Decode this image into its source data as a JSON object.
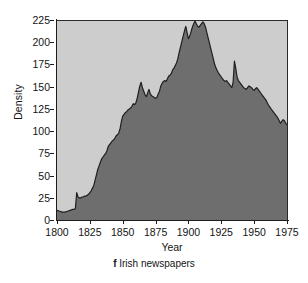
{
  "figure": {
    "caption_letter": "f",
    "caption_text": "Irish newspapers"
  },
  "colors": {
    "plot_background": "#cdcdcd",
    "area_fill": "#6e6e6e",
    "area_line": "#1f1f1f",
    "axis": "#1c1c1c",
    "text": "#141414",
    "page_background": "#ffffff"
  },
  "chart_data": {
    "type": "area",
    "title": "",
    "subtitle": "",
    "xlabel": "Year",
    "ylabel": "Density",
    "xlim": [
      1800,
      1975
    ],
    "ylim": [
      0,
      225
    ],
    "xticks": [
      1800,
      1825,
      1850,
      1875,
      1900,
      1925,
      1950,
      1975
    ],
    "xtick_labels": [
      "1800",
      "1825",
      "1850",
      "1875",
      "1900",
      "1925",
      "1950",
      "1975"
    ],
    "yticks": [
      0,
      25,
      50,
      75,
      100,
      125,
      150,
      175,
      200,
      225
    ],
    "ytick_labels": [
      "0",
      "25",
      "50",
      "75",
      "100",
      "125",
      "150",
      "175",
      "200",
      "225"
    ],
    "grid": false,
    "legend": null,
    "legend_position": "none",
    "series": [
      {
        "name": "Irish newspapers density",
        "x": [
          1800,
          1802,
          1804,
          1806,
          1808,
          1810,
          1812,
          1813,
          1814,
          1815,
          1816,
          1817,
          1818,
          1819,
          1820,
          1821,
          1822,
          1823,
          1824,
          1825,
          1826,
          1827,
          1828,
          1829,
          1830,
          1831,
          1832,
          1833,
          1834,
          1835,
          1836,
          1837,
          1838,
          1839,
          1840,
          1841,
          1842,
          1843,
          1844,
          1845,
          1846,
          1847,
          1848,
          1849,
          1850,
          1851,
          1852,
          1853,
          1854,
          1855,
          1856,
          1857,
          1858,
          1859,
          1860,
          1861,
          1862,
          1863,
          1864,
          1865,
          1866,
          1867,
          1868,
          1869,
          1870,
          1871,
          1872,
          1873,
          1874,
          1875,
          1876,
          1877,
          1878,
          1879,
          1880,
          1881,
          1882,
          1883,
          1884,
          1885,
          1886,
          1887,
          1888,
          1889,
          1890,
          1891,
          1892,
          1893,
          1894,
          1895,
          1896,
          1897,
          1898,
          1899,
          1900,
          1901,
          1902,
          1903,
          1904,
          1905,
          1906,
          1907,
          1908,
          1909,
          1910,
          1911,
          1912,
          1913,
          1914,
          1915,
          1916,
          1917,
          1918,
          1919,
          1920,
          1921,
          1922,
          1923,
          1924,
          1925,
          1926,
          1927,
          1928,
          1929,
          1930,
          1931,
          1932,
          1933,
          1934,
          1935,
          1936,
          1937,
          1938,
          1939,
          1940,
          1941,
          1942,
          1943,
          1944,
          1945,
          1946,
          1947,
          1948,
          1949,
          1950,
          1951,
          1952,
          1953,
          1954,
          1955,
          1956,
          1957,
          1958,
          1959,
          1960,
          1961,
          1962,
          1963,
          1964,
          1965,
          1966,
          1967,
          1968,
          1969,
          1970,
          1971,
          1972,
          1973,
          1974,
          1975
        ],
        "y": [
          12,
          11,
          10,
          10,
          11,
          12,
          13,
          13,
          14,
          32,
          27,
          26,
          26,
          27,
          27,
          28,
          28,
          29,
          30,
          32,
          34,
          37,
          40,
          46,
          52,
          58,
          62,
          66,
          70,
          72,
          74,
          76,
          79,
          84,
          86,
          88,
          90,
          91,
          93,
          96,
          97,
          99,
          104,
          112,
          118,
          120,
          122,
          123,
          125,
          126,
          127,
          129,
          132,
          131,
          133,
          138,
          145,
          152,
          156,
          150,
          146,
          142,
          140,
          144,
          148,
          143,
          141,
          140,
          139,
          138,
          139,
          143,
          146,
          152,
          155,
          157,
          158,
          157,
          160,
          163,
          164,
          166,
          170,
          172,
          175,
          178,
          183,
          190,
          196,
          202,
          208,
          214,
          219,
          212,
          205,
          208,
          213,
          218,
          222,
          225,
          222,
          219,
          218,
          220,
          222,
          224,
          222,
          218,
          212,
          206,
          200,
          194,
          188,
          182,
          176,
          172,
          169,
          166,
          164,
          162,
          160,
          158,
          157,
          158,
          156,
          154,
          152,
          150,
          156,
          180,
          172,
          162,
          158,
          156,
          154,
          152,
          150,
          149,
          148,
          150,
          152,
          151,
          150,
          148,
          147,
          149,
          150,
          148,
          146,
          144,
          142,
          140,
          138,
          136,
          133,
          130,
          128,
          126,
          124,
          122,
          120,
          118,
          116,
          113,
          110,
          112,
          114,
          113,
          110,
          108
        ]
      }
    ],
    "annotations": []
  }
}
